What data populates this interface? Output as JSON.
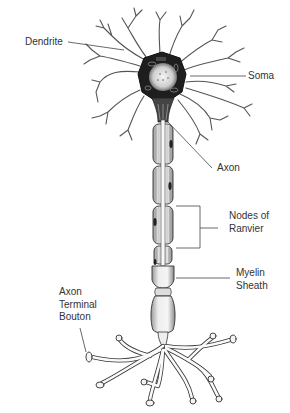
{
  "diagram": {
    "labels": {
      "dendrite": "Dendrite",
      "soma": "Soma",
      "axon": "Axon",
      "nodes_line1": "Nodes of",
      "nodes_line2": "Ranvier",
      "myelin_line1": "Myelin",
      "myelin_line2": "Sheath",
      "terminal_line1": "Axon",
      "terminal_line2": "Terminal",
      "terminal_line3": "Bouton"
    },
    "colors": {
      "line": "#444444",
      "outline": "#555555",
      "fill_dark": "#1a1a1a",
      "fill_light": "#f2f2f2",
      "text": "#333333",
      "background": "#ffffff"
    }
  }
}
